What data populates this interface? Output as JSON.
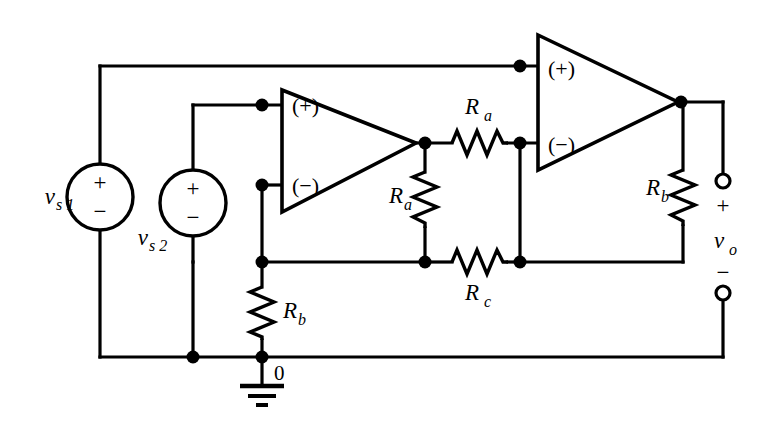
{
  "diagram": {
    "type": "schematic",
    "colors": {
      "wire": "#000000",
      "background": "#ffffff",
      "fill": "#ffffff"
    },
    "sources": [
      {
        "id": "vs1",
        "name": "v",
        "subscript": "s 1",
        "plus": "+",
        "minus": "−"
      },
      {
        "id": "vs2",
        "name": "v",
        "subscript": "s 2",
        "plus": "+",
        "minus": "−"
      }
    ],
    "opamps": [
      {
        "id": "opamp1",
        "plus_port": "(+)",
        "minus_port": "(−)"
      },
      {
        "id": "opamp2",
        "plus_port": "(+)",
        "minus_port": "(−)"
      }
    ],
    "resistors": [
      {
        "id": "ra-top",
        "name": "R",
        "subscript": "a",
        "orientation": "horizontal"
      },
      {
        "id": "ra-vertical",
        "name": "R",
        "subscript": "a",
        "orientation": "vertical"
      },
      {
        "id": "rc-bottom",
        "name": "R",
        "subscript": "c",
        "orientation": "horizontal"
      },
      {
        "id": "rb-left",
        "name": "R",
        "subscript": "b",
        "orientation": "vertical"
      },
      {
        "id": "rb-right",
        "name": "R",
        "subscript": "b",
        "orientation": "vertical"
      }
    ],
    "output": {
      "name": "v",
      "subscript": "o",
      "plus": "+",
      "minus": "−"
    },
    "ground": {
      "label": "0",
      "symbol": "ground-symbol"
    }
  }
}
